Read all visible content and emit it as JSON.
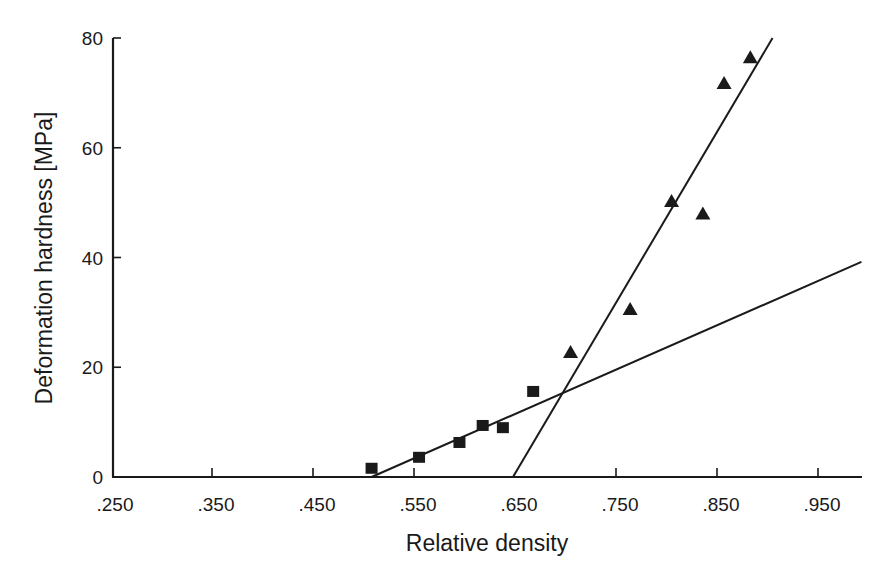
{
  "chart_data": {
    "type": "scatter",
    "title": "",
    "xlabel": "Relative density",
    "ylabel": "Deformation hardness [MPa]",
    "xlim": [
      0.25,
      1.0
    ],
    "ylim": [
      0,
      80
    ],
    "x_ticks": [
      0.25,
      0.35,
      0.45,
      0.55,
      0.65,
      0.75,
      0.85,
      0.95
    ],
    "x_tick_labels": [
      ".250",
      ".350",
      ".450",
      ".550",
      ".650",
      ".750",
      ".850",
      ".950"
    ],
    "y_ticks": [
      0,
      20,
      40,
      60,
      80
    ],
    "y_tick_labels": [
      "0",
      "20",
      "40",
      "60",
      "80"
    ],
    "grid": false,
    "legend": null,
    "series": [
      {
        "name": "squares",
        "marker": "square",
        "color": "#1a1a1a",
        "x": [
          0.508,
          0.555,
          0.595,
          0.618,
          0.638,
          0.668
        ],
        "y": [
          1.5,
          3.5,
          6.2,
          9.3,
          8.9,
          15.5
        ]
      },
      {
        "name": "triangles",
        "marker": "triangle",
        "color": "#1a1a1a",
        "x": [
          0.705,
          0.764,
          0.805,
          0.836,
          0.857,
          0.883
        ],
        "y": [
          22.8,
          30.6,
          50.3,
          48.0,
          71.8,
          76.5
        ]
      }
    ],
    "fit_lines": [
      {
        "name": "low-density fit",
        "x": [
          0.508,
          0.993
        ],
        "y": [
          0,
          39.2
        ]
      },
      {
        "name": "high-density fit",
        "x": [
          0.648,
          0.905
        ],
        "y": [
          0,
          80
        ]
      }
    ]
  }
}
